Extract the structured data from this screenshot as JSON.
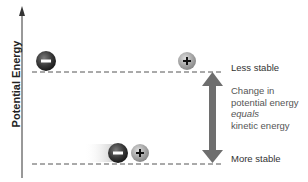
{
  "diagram": {
    "y_axis_label": "Potential Energy",
    "levels": {
      "upper_label": "Less stable",
      "lower_label": "More stable"
    },
    "arrow_description": {
      "line1": "Change in",
      "line2": "potential energy",
      "line3": "equals",
      "line4": "kinetic energy"
    },
    "ions": {
      "negative_symbol": "−",
      "positive_symbol": "+"
    },
    "colors": {
      "negative_ion": "#3a3a3a",
      "positive_ion": "#a8a8a8",
      "arrow": "#6e6e6e",
      "dash": "#555555"
    }
  }
}
